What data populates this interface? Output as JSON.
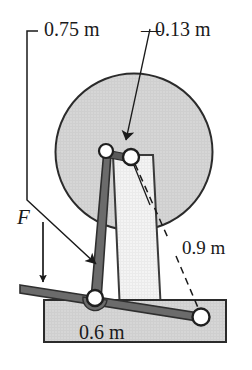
{
  "figure": {
    "type": "engineering-mechanics-schematic",
    "labels": {
      "dim_top_left": "0.75 m",
      "dim_top_right": "0.13 m",
      "dim_right": "0.9 m",
      "dim_bottom": "0.6 m",
      "force": "F",
      "dash_prefix": "—"
    },
    "colors": {
      "outline": "#2b2b2b",
      "wheel_fill": "#d4d4d4",
      "post_fill": "#f2f2f2",
      "base_fill": "#d4d4d4",
      "bar_fill": "#5f5f5f",
      "pin_fill": "#ffffff",
      "background": "#ffffff"
    },
    "elements": [
      {
        "name": "wheel",
        "shape": "circle",
        "cx": 134,
        "cy": 152,
        "r": 79
      },
      {
        "name": "vertical-post",
        "shape": "tapered-rectangle",
        "top_y": 155,
        "bottom_y": 312
      },
      {
        "name": "base-block",
        "shape": "rectangle",
        "x": 44,
        "y": 300,
        "w": 182,
        "h": 42
      },
      {
        "name": "lever-arm",
        "shape": "thick-line",
        "from": [
          21,
          289
        ],
        "to": [
          205,
          320
        ]
      },
      {
        "name": "inclined-link",
        "shape": "thick-line",
        "from": [
          107,
          152
        ],
        "to": [
          95,
          299
        ]
      },
      {
        "name": "pin-upper-left",
        "shape": "circle",
        "cx": 107,
        "cy": 152,
        "r": 7
      },
      {
        "name": "pin-upper-right",
        "shape": "circle",
        "cx": 131,
        "cy": 157,
        "r": 8
      },
      {
        "name": "pin-lower-left",
        "shape": "circle",
        "cx": 95,
        "cy": 299,
        "r": 8
      },
      {
        "name": "pin-lower-right",
        "shape": "circle",
        "cx": 201,
        "cy": 318,
        "r": 8
      },
      {
        "name": "force-arrow",
        "shape": "arrow",
        "from": [
          43,
          222
        ],
        "to": [
          43,
          288
        ]
      },
      {
        "name": "leader-075",
        "shape": "polyline-arrow",
        "points": "27,32 27,200 97,265"
      },
      {
        "name": "leader-013",
        "shape": "line-arrow",
        "from": [
          150,
          30
        ],
        "to": [
          123,
          146
        ]
      },
      {
        "name": "leader-09",
        "shape": "dashed-line",
        "from": [
          133,
          163
        ],
        "to": [
          199,
          314
        ]
      }
    ]
  }
}
